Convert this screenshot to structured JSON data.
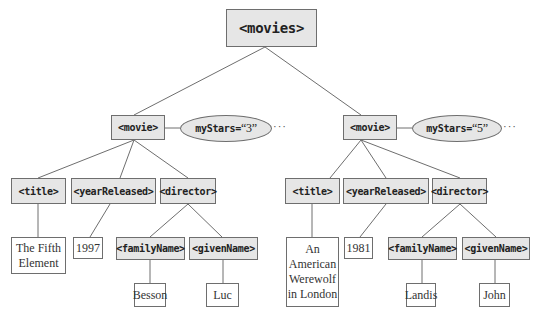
{
  "root": {
    "label": "<movies>"
  },
  "movies": [
    {
      "label": "<movie>",
      "attribute": {
        "name": "myStars=",
        "value": "“3”"
      },
      "more": "···",
      "children": {
        "title": {
          "label": "<title>",
          "text": [
            "The Fifth",
            "Element"
          ]
        },
        "yearReleased": {
          "label": "<yearReleased>",
          "text": "1997"
        },
        "director": {
          "label": "<director>",
          "familyName": {
            "label": "<familyName>",
            "text": "Besson"
          },
          "givenName": {
            "label": "<givenName>",
            "text": "Luc"
          }
        }
      }
    },
    {
      "label": "<movie>",
      "attribute": {
        "name": "myStars=",
        "value": "“5”"
      },
      "more": "···",
      "children": {
        "title": {
          "label": "<title>",
          "text": [
            "An",
            "American",
            "Werewolf",
            "in London"
          ]
        },
        "yearReleased": {
          "label": "<yearReleased>",
          "text": "1981"
        },
        "director": {
          "label": "<director>",
          "familyName": {
            "label": "<familyName>",
            "text": "Landis"
          },
          "givenName": {
            "label": "<givenName>",
            "text": "John"
          }
        }
      }
    }
  ],
  "colors": {
    "element_fill": "#e6e6e6",
    "text_fill": "#ffffff",
    "stroke": "#6e6e6e"
  }
}
